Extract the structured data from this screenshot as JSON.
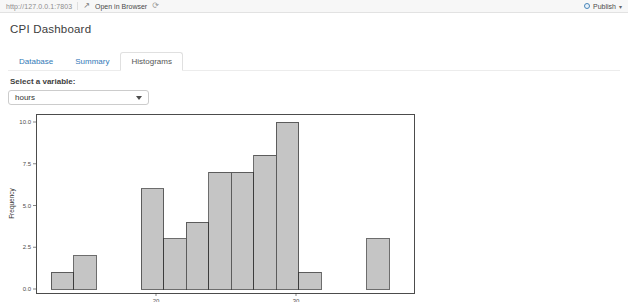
{
  "toolbar": {
    "url": "http://127.0.0.1:7803",
    "open_in_browser_label": "Open in Browser",
    "publish_label": "Publish",
    "icons": {
      "open_in_browser": "↗",
      "refresh": "⟳",
      "publish_caret": "▾"
    }
  },
  "header": {
    "title": "CPI Dashboard"
  },
  "tabs": [
    {
      "label": "Database",
      "active": false
    },
    {
      "label": "Summary",
      "active": false
    },
    {
      "label": "Histograms",
      "active": true
    }
  ],
  "controls": {
    "select_label": "Select a variable:",
    "select_value": "hours"
  },
  "chart_data": {
    "type": "bar",
    "subtype": "histogram",
    "title": "",
    "xlabel": "",
    "ylabel": "Frequency",
    "variable": "hours",
    "bins": {
      "start": 12.5,
      "width": 1.61,
      "counts": [
        1,
        2,
        0,
        0,
        6,
        3,
        4,
        7,
        7,
        8,
        10,
        1,
        0,
        0,
        3
      ]
    },
    "total_observations": 52,
    "x_ticks": [
      {
        "value": 20,
        "label": "20"
      },
      {
        "value": 30,
        "label": "30"
      }
    ],
    "y_ticks": [
      {
        "value": 0,
        "label": "0.0"
      },
      {
        "value": 2.5,
        "label": "2.5"
      },
      {
        "value": 5,
        "label": "5.0"
      },
      {
        "value": 7.5,
        "label": "7.5"
      },
      {
        "value": 10,
        "label": "10.0"
      }
    ],
    "x_range": [
      11.4,
      38.4
    ],
    "y_range": [
      -0.25,
      10.5
    ],
    "grid": false,
    "legend": false,
    "colors": {
      "bar_fill": "#c5c5c5",
      "bar_stroke": "#2f2f2f",
      "panel_border": "#1f1f1f",
      "tick_text": "#4d4d4d",
      "axis_label": "#333333"
    }
  }
}
